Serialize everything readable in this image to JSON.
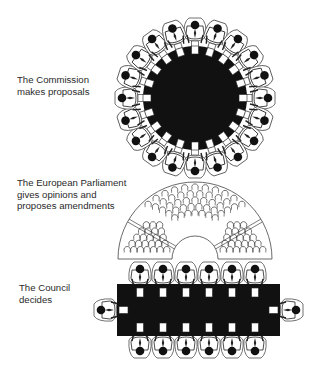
{
  "labels": {
    "commission": "The Commission\nmakes proposals",
    "parliament": "The European Parliament\ngives opinions and\nproposes amendments",
    "council": "The Council\ndecides"
  },
  "colors": {
    "ink": "#111111",
    "line": "#333333",
    "paper": "#ffffff"
  },
  "commission": {
    "shape": "round-table",
    "center": [
      195,
      98
    ],
    "table_radius": 52,
    "seat_radius": 66,
    "people_count": 20
  },
  "parliament": {
    "shape": "hemicycle",
    "center": [
      195,
      259
    ],
    "outer_radius": 77,
    "inner_radius": 23,
    "sections": [
      {
        "name": "left",
        "seats": 28
      },
      {
        "name": "center",
        "seats": 45
      },
      {
        "name": "right",
        "seats": 28
      }
    ]
  },
  "council": {
    "shape": "rectangular-table",
    "table": {
      "x": 117,
      "y": 284,
      "w": 163,
      "h": 52
    },
    "top_row_x": [
      140,
      163,
      186,
      209,
      232,
      255
    ],
    "top_row_y": 282,
    "bottom_row_y": 338,
    "ends": [
      {
        "x": 108,
        "y": 310,
        "side": "left"
      },
      {
        "x": 289,
        "y": 310,
        "side": "right"
      }
    ]
  }
}
